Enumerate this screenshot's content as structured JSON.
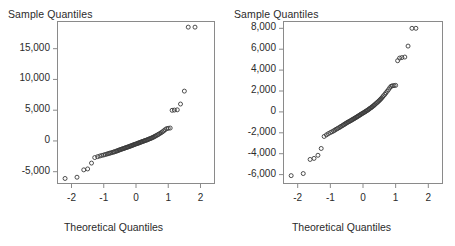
{
  "figure": {
    "width": 455,
    "height": 246,
    "background": "#ffffff",
    "marker_color": "#3a3a3a",
    "axis_color": "#8a8a8a",
    "text_color": "#2b2b2b"
  },
  "chart_data": [
    {
      "type": "scatter",
      "title": "",
      "panel": "left",
      "ylabel": "Sample Quantiles",
      "xlabel": "Theoretical Quantiles",
      "grid": false,
      "legend": "none",
      "xlim": [
        -2.45,
        2.45
      ],
      "ylim": [
        -7000,
        19500
      ],
      "xticks": [
        -2,
        -1,
        0,
        1,
        2
      ],
      "xticklabels": [
        "-2",
        "-1",
        "0",
        "1",
        "2"
      ],
      "yticks": [
        -5000,
        0,
        5000,
        10000,
        15000
      ],
      "yticklabels": [
        "-5,000",
        "0",
        "5,000",
        "10,000",
        "15,000"
      ],
      "x": [
        -2.2,
        -1.83,
        -1.62,
        -1.5,
        -1.38,
        -1.28,
        -1.19,
        -1.12,
        -1.06,
        -1.0,
        -0.95,
        -0.9,
        -0.86,
        -0.82,
        -0.78,
        -0.74,
        -0.7,
        -0.67,
        -0.63,
        -0.6,
        -0.57,
        -0.54,
        -0.51,
        -0.48,
        -0.45,
        -0.42,
        -0.39,
        -0.36,
        -0.34,
        -0.31,
        -0.28,
        -0.26,
        -0.23,
        -0.2,
        -0.18,
        -0.15,
        -0.13,
        -0.1,
        -0.08,
        -0.05,
        -0.03,
        0.0,
        0.03,
        0.05,
        0.08,
        0.1,
        0.13,
        0.15,
        0.18,
        0.2,
        0.23,
        0.26,
        0.28,
        0.31,
        0.34,
        0.36,
        0.39,
        0.42,
        0.45,
        0.48,
        0.51,
        0.54,
        0.57,
        0.6,
        0.63,
        0.67,
        0.7,
        0.74,
        0.78,
        0.82,
        0.86,
        0.9,
        0.95,
        1.0,
        1.06,
        1.12,
        1.19,
        1.28,
        1.38,
        1.5,
        1.62,
        1.83,
        2.2
      ],
      "y": [
        -6100,
        -5900,
        -4700,
        -4550,
        -3600,
        -2700,
        -2550,
        -2450,
        -2350,
        -2280,
        -2200,
        -2130,
        -2060,
        -2000,
        -1940,
        -1880,
        -1820,
        -1760,
        -1700,
        -1640,
        -1580,
        -1520,
        -1460,
        -1400,
        -1340,
        -1290,
        -1240,
        -1190,
        -1140,
        -1090,
        -1040,
        -990,
        -940,
        -890,
        -840,
        -790,
        -740,
        -690,
        -640,
        -590,
        -540,
        -490,
        -440,
        -390,
        -340,
        -290,
        -240,
        -190,
        -140,
        -90,
        -40,
        10,
        60,
        110,
        160,
        220,
        280,
        340,
        400,
        470,
        540,
        620,
        700,
        790,
        880,
        980,
        1090,
        1210,
        1340,
        1480,
        1640,
        1820,
        2000,
        2050,
        2100,
        4980,
        5020,
        5060,
        6000,
        8100,
        18500,
        18500
      ]
    },
    {
      "type": "scatter",
      "title": "",
      "panel": "right",
      "ylabel": "Sample Quantiles",
      "xlabel": "Theoretical Quantiles",
      "grid": false,
      "legend": "none",
      "xlim": [
        -2.45,
        2.45
      ],
      "ylim": [
        -6900,
        8700
      ],
      "xticks": [
        -2,
        -1,
        0,
        1,
        2
      ],
      "xticklabels": [
        "-2",
        "-1",
        "0",
        "1",
        "2"
      ],
      "yticks": [
        -6000,
        -4000,
        -2000,
        0,
        2000,
        4000,
        6000,
        8000
      ],
      "yticklabels": [
        "-6,000",
        "-4,000",
        "-2,000",
        "0",
        "2,000",
        "4,000",
        "6,000",
        "8,000"
      ],
      "x": [
        -2.2,
        -1.83,
        -1.62,
        -1.5,
        -1.38,
        -1.28,
        -1.19,
        -1.12,
        -1.06,
        -1.0,
        -0.95,
        -0.9,
        -0.86,
        -0.82,
        -0.78,
        -0.74,
        -0.7,
        -0.67,
        -0.63,
        -0.6,
        -0.57,
        -0.54,
        -0.51,
        -0.48,
        -0.45,
        -0.42,
        -0.39,
        -0.36,
        -0.34,
        -0.31,
        -0.28,
        -0.26,
        -0.23,
        -0.2,
        -0.18,
        -0.15,
        -0.13,
        -0.1,
        -0.08,
        -0.05,
        -0.03,
        0.0,
        0.03,
        0.05,
        0.08,
        0.1,
        0.13,
        0.15,
        0.18,
        0.2,
        0.23,
        0.26,
        0.28,
        0.31,
        0.34,
        0.36,
        0.39,
        0.42,
        0.45,
        0.48,
        0.51,
        0.54,
        0.57,
        0.6,
        0.63,
        0.67,
        0.7,
        0.74,
        0.78,
        0.82,
        0.86,
        0.9,
        0.95,
        1.0,
        1.06,
        1.12,
        1.19,
        1.28,
        1.38,
        1.5,
        1.62,
        1.83,
        2.2
      ],
      "y": [
        -6100,
        -5900,
        -4550,
        -4450,
        -4150,
        -3500,
        -2350,
        -2200,
        -2080,
        -1980,
        -1900,
        -1820,
        -1740,
        -1660,
        -1590,
        -1520,
        -1450,
        -1380,
        -1310,
        -1250,
        -1190,
        -1130,
        -1070,
        -1010,
        -960,
        -910,
        -860,
        -810,
        -760,
        -710,
        -660,
        -610,
        -560,
        -510,
        -460,
        -410,
        -360,
        -310,
        -260,
        -210,
        -160,
        -110,
        -60,
        -10,
        40,
        90,
        140,
        190,
        250,
        310,
        370,
        430,
        490,
        560,
        630,
        700,
        780,
        860,
        940,
        1030,
        1120,
        1220,
        1320,
        1430,
        1550,
        1680,
        1820,
        1970,
        2130,
        2310,
        2450,
        2500,
        2520,
        2540,
        4900,
        5150,
        5200,
        5250,
        6300,
        8000,
        8000
      ]
    }
  ],
  "panels": {
    "left": {
      "ylabel": "Sample Quantiles",
      "xlabel": "Theoretical Quantiles"
    },
    "right": {
      "ylabel": "Sample Quantiles",
      "xlabel": "Theoretical Quantiles"
    }
  }
}
